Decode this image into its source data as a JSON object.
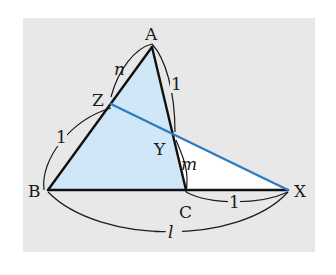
{
  "colors": {
    "panel": "#e8e8e8",
    "fill": "#cfe7f6",
    "edge": "#111111",
    "transversal": "#2b7cc0",
    "arc": "#1a1a1a"
  },
  "points": {
    "A": {
      "label": "A",
      "x": 152,
      "y": 47
    },
    "B": {
      "label": "B",
      "x": 48,
      "y": 190
    },
    "C": {
      "label": "C",
      "x": 186,
      "y": 190
    },
    "X": {
      "label": "X",
      "x": 288,
      "y": 190
    },
    "Y": {
      "label": "Y",
      "x": 172,
      "y": 133
    },
    "Z": {
      "label": "Z",
      "x": 111,
      "y": 104
    }
  },
  "segment_labels": {
    "AZ": "n",
    "ZB": "1",
    "AY": "1",
    "YC": "m",
    "CX": "1",
    "BX": "l"
  }
}
